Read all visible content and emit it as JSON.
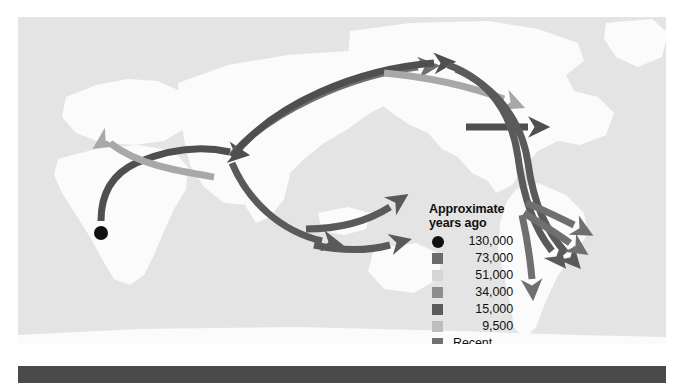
{
  "figure": {
    "type": "world-migration-map",
    "background_color": "#ffffff",
    "map_background_color": "#e4e4e4",
    "landmass_color": "#fbfbfb",
    "bottom_bar_color": "#4a4a4a"
  },
  "legend": {
    "title": "Approximate\nyears ago",
    "entries": [
      {
        "label": "130,000",
        "color": "#111111",
        "shape": "dot"
      },
      {
        "label": "73,000",
        "color": "#6b6b6b",
        "shape": "square"
      },
      {
        "label": "51,000",
        "color": "#d6d6d6",
        "shape": "square"
      },
      {
        "label": "34,000",
        "color": "#8d8d8d",
        "shape": "square"
      },
      {
        "label": "15,000",
        "color": "#5a5a5a",
        "shape": "square"
      },
      {
        "label": "9,500",
        "color": "#bdbdbd",
        "shape": "square"
      },
      {
        "label": "Recent",
        "color": "#707070",
        "shape": "square"
      }
    ]
  },
  "map": {
    "origin_marker": {
      "name": "origin-point-africa",
      "x": 83,
      "y": 216,
      "radius": 7,
      "color": "#111111"
    },
    "routes": [
      {
        "name": "africa-to-asia-hub",
        "color": "#4f4f4f",
        "width": 7,
        "path": "M 83 204 C 83 180 92 158 118 146 C 160 128 190 130 212 135",
        "arrow": {
          "x": 216,
          "y": 136,
          "angle": 8
        }
      },
      {
        "name": "africa-to-europe",
        "color": "#a8a8a8",
        "width": 7,
        "path": "M 196 160 C 160 154 120 148 92 126",
        "arrow": {
          "x": 88,
          "y": 123,
          "angle": -214
        }
      },
      {
        "name": "hub-to-northeast-asia-upper",
        "color": "#6f6f6f",
        "width": 7,
        "path": "M 214 138 C 250 96 330 58 400 50",
        "arrow": {
          "x": 406,
          "y": 50,
          "angle": -5
        }
      },
      {
        "name": "hub-to-beringia-dark",
        "color": "#4f4f4f",
        "width": 7,
        "path": "M 214 140 C 256 86 340 52 416 46",
        "arrow": {
          "x": 422,
          "y": 46,
          "angle": -4
        }
      },
      {
        "name": "beringia-to-north-america-light",
        "color": "#a8a8a8",
        "width": 7,
        "path": "M 366 56 C 410 60 448 68 486 82",
        "arrow": {
          "x": 492,
          "y": 85,
          "angle": 22
        }
      },
      {
        "name": "north-america-eastward",
        "color": "#4f4f4f",
        "width": 7,
        "path": "M 448 110 C 470 110 492 110 510 110",
        "arrow": {
          "x": 516,
          "y": 110,
          "angle": 0
        }
      },
      {
        "name": "americas-corridor-outer",
        "color": "#5a5a5a",
        "width": 7,
        "path": "M 430 48 C 470 62 494 96 500 140 C 506 186 518 214 534 234",
        "arrow": {
          "x": 538,
          "y": 239,
          "angle": 52
        }
      },
      {
        "name": "americas-corridor-inner",
        "color": "#5a5a5a",
        "width": 7,
        "path": "M 438 52 C 478 70 504 104 510 146 C 516 190 530 216 548 236",
        "arrow": {
          "x": 552,
          "y": 240,
          "angle": 48
        }
      },
      {
        "name": "south-america-branch-northeast",
        "color": "#6f6f6f",
        "width": 7,
        "path": "M 508 186 C 524 192 540 200 556 208",
        "arrow": {
          "x": 561,
          "y": 211,
          "angle": 28
        }
      },
      {
        "name": "south-america-branch-east",
        "color": "#6f6f6f",
        "width": 7,
        "path": "M 506 196 C 522 206 538 216 552 226",
        "arrow": {
          "x": 557,
          "y": 229,
          "angle": 34
        }
      },
      {
        "name": "south-america-branch-south",
        "color": "#6f6f6f",
        "width": 7,
        "path": "M 504 198 C 508 216 512 240 514 262",
        "arrow": {
          "x": 514,
          "y": 268,
          "angle": 86
        }
      },
      {
        "name": "hub-to-south-asia",
        "color": "#5a5a5a",
        "width": 7,
        "path": "M 214 146 C 230 184 262 214 304 224",
        "arrow": {
          "x": 310,
          "y": 225,
          "angle": 12
        }
      },
      {
        "name": "southeast-asia-to-australia-upper",
        "color": "#5a5a5a",
        "width": 7,
        "path": "M 288 212 C 320 212 350 204 372 190",
        "arrow": {
          "x": 377,
          "y": 186,
          "angle": -34
        }
      },
      {
        "name": "southeast-asia-to-australia-lower",
        "color": "#5a5a5a",
        "width": 7,
        "path": "M 296 228 C 324 234 350 234 372 228",
        "arrow": {
          "x": 378,
          "y": 226,
          "angle": -14
        }
      }
    ]
  }
}
